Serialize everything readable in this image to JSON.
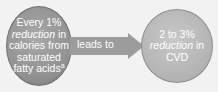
{
  "diagram": {
    "left_node": {
      "line1": "Every 1%",
      "line2_italic": "reduction",
      "line2_rest": " in",
      "line3": "calories from",
      "line4": "saturated",
      "line5": "fatty acids",
      "footnote_marker": "a"
    },
    "connector": {
      "label": "leads to"
    },
    "right_node": {
      "line1": "2 to 3%",
      "line2_italic": "reduction",
      "line2_rest": " in",
      "line3": "CVD"
    },
    "colors": {
      "left_fill": "#8f8f8f",
      "right_fill": "#b3b3b3",
      "arrow_fill": "#9c9c9c",
      "text": "#ffffff",
      "background": "#f2f2f2"
    }
  }
}
